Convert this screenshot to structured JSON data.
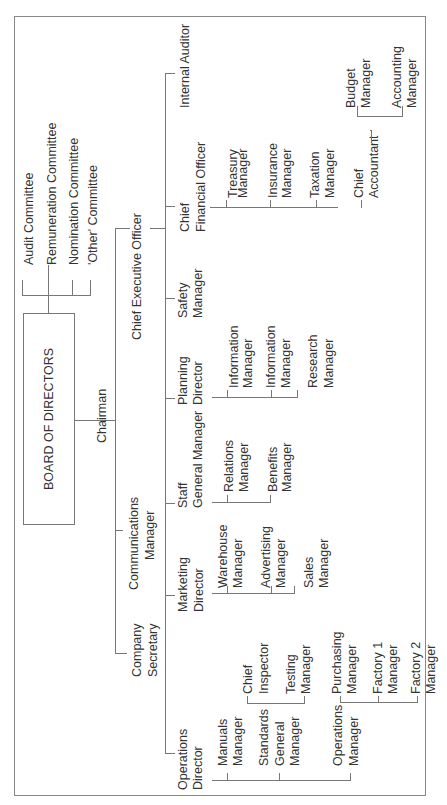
{
  "chart": {
    "board": "BOARD OF DIRECTORS",
    "committees": [
      "Audit Committee",
      "Remuneration Committee",
      "Nomination Committee",
      "'Other' Committee"
    ],
    "chairman": "Chairman",
    "chief_executive": "Chief Executive Officer",
    "company_secretary": [
      "Company",
      "Secretary"
    ],
    "communications_manager": [
      "Communications",
      "Manager"
    ],
    "internal_auditor": "Internal Auditor",
    "cfo": {
      "title": [
        "Chief",
        "Financial Officer"
      ],
      "reports": [
        [
          "Treasury",
          "Manager"
        ],
        [
          "Insurance",
          "Manager"
        ],
        [
          "Taxation",
          "Manager"
        ],
        [
          "Chief",
          "Accountant"
        ]
      ],
      "chief_accountant_reports": [
        [
          "Budget",
          "Manager"
        ],
        [
          "Accounting",
          "Manager"
        ]
      ]
    },
    "safety_manager": [
      "Safety",
      "Manager"
    ],
    "planning_director": {
      "title": [
        "Planning",
        "Director"
      ],
      "reports": [
        [
          "Information",
          "Manager"
        ],
        [
          "Information",
          "Manager"
        ],
        [
          "Research",
          "Manager"
        ]
      ]
    },
    "staff_gm": {
      "title": [
        "Staff",
        "General Manager"
      ],
      "reports": [
        [
          "Relations",
          "Manager"
        ],
        [
          "Benefits",
          "Manager"
        ]
      ]
    },
    "marketing_director": {
      "title": [
        "Marketing",
        "Director"
      ],
      "reports": [
        [
          "Warehouse",
          "Manager"
        ],
        [
          "Advertising",
          "Manager"
        ],
        [
          "Sales",
          "Manager"
        ]
      ]
    },
    "operations_director": {
      "title": [
        "Operations",
        "Director"
      ],
      "reports": [
        [
          "Manuals",
          "Manager"
        ],
        [
          "Standards",
          "General",
          "Manager"
        ],
        [
          "Operations",
          "Manager"
        ]
      ],
      "standards_reports": [
        [
          "Chief",
          "Inspector"
        ],
        [
          "Testing",
          "Manager"
        ]
      ],
      "operations_reports": [
        [
          "Purchasing",
          "Manager"
        ],
        [
          "Factory 1",
          "Manager"
        ],
        [
          "Factory 2",
          "Manager"
        ]
      ]
    }
  },
  "colors": {
    "line": "#777777",
    "text": "#333333",
    "background": "#ffffff"
  }
}
